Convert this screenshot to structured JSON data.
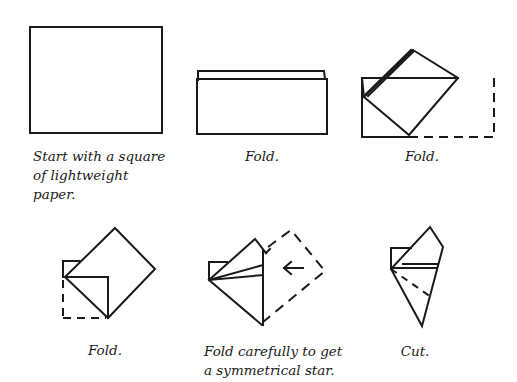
{
  "stroke_color": "#1a1a1a",
  "steps": [
    {
      "id": 1,
      "caption": "Start with a square\nof lightweight\npaper."
    },
    {
      "id": 2,
      "caption": "Fold."
    },
    {
      "id": 3,
      "caption": "Fold."
    },
    {
      "id": 4,
      "caption": "Fold."
    },
    {
      "id": 5,
      "caption": "Fold carefully to get\na symmetrical star."
    },
    {
      "id": 6,
      "caption": "Cut."
    }
  ],
  "annotations": {
    "step5_arrow": "left-arrow"
  }
}
